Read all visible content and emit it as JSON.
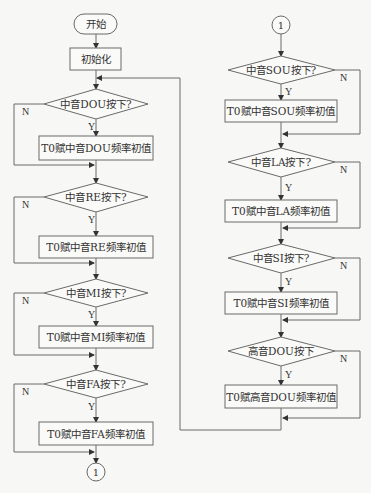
{
  "diagram": {
    "type": "flowchart",
    "start": {
      "label": "开始"
    },
    "init": {
      "label": "初始化"
    },
    "connector_label": "1",
    "yes_label": "Y",
    "no_label": "N",
    "left_column": [
      {
        "decision": "中音DOU按下?",
        "action": "T0赋中音DOU频率初值"
      },
      {
        "decision": "中音RE按下?",
        "action": "T0赋中音RE频率初值"
      },
      {
        "decision": "中音MI按下?",
        "action": "T0赋中音MI频率初值"
      },
      {
        "decision": "中音FA按下?",
        "action": "T0赋中音FA频率初值"
      }
    ],
    "right_column": [
      {
        "decision": "中音SOU按下?",
        "action": "T0赋中音SOU频率初值"
      },
      {
        "decision": "中音LA按下?",
        "action": "T0赋中音LA频率初值"
      },
      {
        "decision": "中音SI按下?",
        "action": "T0赋中音SI频率初值"
      },
      {
        "decision": "高音DOU按下",
        "action": "T0赋高音DOU频率初值"
      }
    ],
    "colors": {
      "line": "#6a6a6a",
      "background": "#f7f7f5",
      "text": "#333333"
    }
  }
}
